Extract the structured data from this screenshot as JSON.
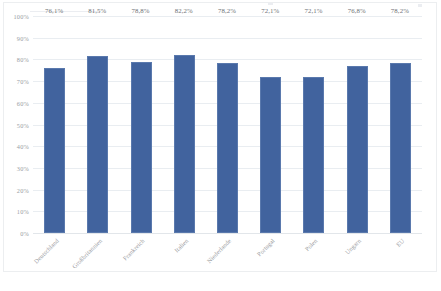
{
  "chart_data": {
    "type": "bar",
    "title": "",
    "subtitle": "",
    "xlabel": "",
    "ylabel": "",
    "ylim": [
      0,
      100
    ],
    "grid": true,
    "legend": false,
    "legend_position": "none",
    "value_suffix": "%",
    "decimal_separator": ",",
    "bar_color": "#41639E",
    "gridline_color": "#e9edf1",
    "label_color": "#9a9ea3",
    "categories": [
      "Deutschland",
      "Großbritannien",
      "Frankreich",
      "Italien",
      "Niederlande",
      "Portugal",
      "Polen",
      "Ungarn",
      "EU"
    ],
    "values": [
      76.1,
      81.5,
      78.8,
      82.2,
      78.2,
      72.1,
      72.1,
      76.8,
      78.2
    ],
    "data_labels": [
      "76,1%",
      "81,5%",
      "78,8%",
      "82,2%",
      "78,2%",
      "72,1%",
      "72,1%",
      "76,8%",
      "78,2%"
    ],
    "yticks": [
      100,
      90,
      80,
      70,
      60,
      50,
      40,
      30,
      20,
      10,
      0
    ],
    "ytick_labels": [
      "100%",
      "90%",
      "80%",
      "70%",
      "60%",
      "50%",
      "40%",
      "30%",
      "20%",
      "10%",
      "0%"
    ]
  }
}
